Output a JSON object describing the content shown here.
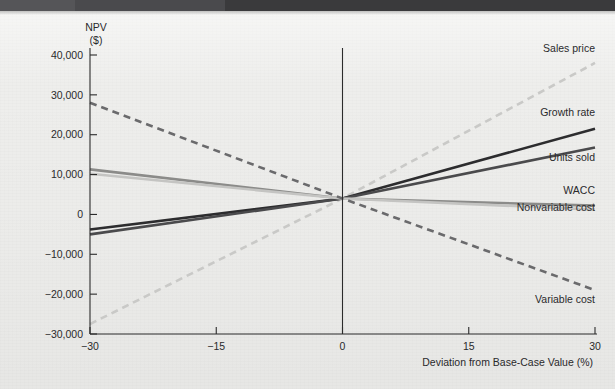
{
  "figure": {
    "background_color": "#eeeeec",
    "header_band_color": "#3a3a3c"
  },
  "axes": {
    "y_title_line1": "NPV",
    "y_title_line2": "($)",
    "x_title": "Deviation from Base-Case Value (%)"
  },
  "chart_data": {
    "type": "line",
    "title": "",
    "subtitle": "",
    "xlabel": "Deviation from Base-Case Value (%)",
    "ylabel": "NPV ($)",
    "xlim": [
      -30,
      30
    ],
    "ylim": [
      -30000,
      40000
    ],
    "xticks": [
      -30,
      -15,
      0,
      15,
      30
    ],
    "xticklabels": [
      "−30",
      "−15",
      "0",
      "15",
      "30"
    ],
    "yticks": [
      -30000,
      -20000,
      -10000,
      0,
      10000,
      20000,
      30000,
      40000
    ],
    "yticklabels": [
      "−30,000",
      "−20,000",
      "−10,000",
      "0",
      "10,000",
      "20,000",
      "30,000",
      "40,000"
    ],
    "grid": false,
    "legend": "inline-right-labels",
    "x": [
      -30,
      0,
      30
    ],
    "series": [
      {
        "name": "Sales price",
        "label": "Sales price",
        "values": [
          -27500,
          4000,
          38000
        ],
        "color": "#c9c9c7",
        "style": "dashed",
        "width": 2.6,
        "label_x": 30,
        "label_y": 40700
      },
      {
        "name": "Growth rate",
        "label": "Growth rate",
        "values": [
          -3800,
          4000,
          21500
        ],
        "color": "#2c2c2e",
        "style": "solid",
        "width": 2.6,
        "label_x": 30,
        "label_y": 24800
      },
      {
        "name": "Units sold",
        "label": "Units sold",
        "values": [
          -5000,
          4000,
          16800
        ],
        "color": "#4a4a4c",
        "style": "solid",
        "width": 2.6,
        "label_x": 30,
        "label_y": 13400
      },
      {
        "name": "WACC",
        "label": "WACC",
        "values": [
          11300,
          4000,
          2200
        ],
        "color": "#8b8b89",
        "style": "solid",
        "width": 2.6,
        "label_x": 30,
        "label_y": 5100
      },
      {
        "name": "Nonvariable cost",
        "label": "Nonvariable cost",
        "values": [
          10200,
          4000,
          1200
        ],
        "color": "#c4c4c2",
        "style": "solid",
        "width": 2.6,
        "label_x": 30,
        "label_y": 900
      },
      {
        "name": "Variable cost",
        "label": "Variable cost",
        "values": [
          28000,
          4000,
          -19000
        ],
        "color": "#6a6a6c",
        "style": "dashed",
        "width": 2.6,
        "label_x": 30,
        "label_y": -22200
      }
    ]
  }
}
